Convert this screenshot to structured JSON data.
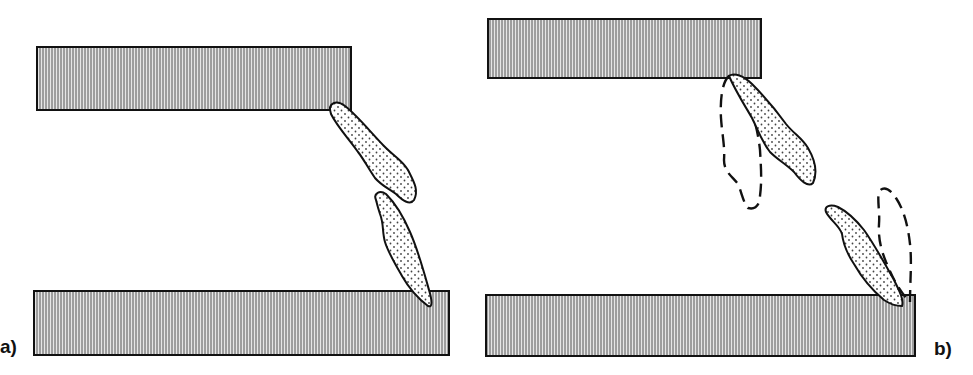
{
  "panels": [
    {
      "label": "a)",
      "description": "Two hatched plates with two dotted fragments bridging the gap between the top plate's right corner and the bottom plate's right end",
      "plates": [
        {
          "name": "top-plate",
          "x": 37,
          "y": 47,
          "w": 314,
          "h": 63
        },
        {
          "name": "bottom-plate",
          "x": 34,
          "y": 291,
          "w": 415,
          "h": 64
        }
      ],
      "fragments": 2,
      "dashed_outlines": 0
    },
    {
      "label": "b)",
      "description": "Two hatched plates with dotted fragments attached at plate corners; dashed outlines show alternate fragment positions",
      "plates": [
        {
          "name": "top-plate",
          "x": 488,
          "y": 19,
          "w": 273,
          "h": 59
        },
        {
          "name": "bottom-plate",
          "x": 486,
          "y": 295,
          "w": 429,
          "h": 61
        }
      ],
      "fragments": 2,
      "dashed_outlines": 2
    }
  ],
  "colors": {
    "hatch_line": "#555555",
    "plate_fill": "#d9d9d9",
    "outline": "#111111",
    "dot": "#444444",
    "background": "#ffffff"
  }
}
